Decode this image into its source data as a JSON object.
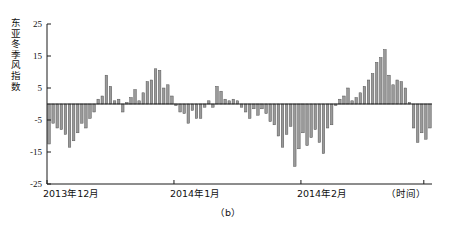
{
  "figure": {
    "caption": "（b）",
    "ylabel_chars": [
      "东",
      "亚",
      "冬",
      "季",
      "风",
      "指",
      "数"
    ]
  },
  "chart_data": {
    "type": "bar",
    "title": "",
    "subtitle": "",
    "xlabel": "（时间）",
    "ylabel": "东亚冬季风指数",
    "caption": "（b）",
    "grid": false,
    "legend": "none",
    "ylim": [
      -25,
      25
    ],
    "yticks": [
      25,
      15,
      5,
      -5,
      -15,
      -25
    ],
    "ytick_labels": [
      "25",
      "15",
      "5",
      "-5",
      "-15",
      "-25"
    ],
    "xtick_positions": [
      0,
      31,
      62,
      92
    ],
    "xtick_labels": [
      "2013年12月",
      "2014年1月",
      "2014年2月",
      "（时间）"
    ],
    "x_axis_note": "逐日 / daily values from 2013-12-01 to 2014-03-02",
    "categories": [
      "12-01",
      "12-02",
      "12-03",
      "12-04",
      "12-05",
      "12-06",
      "12-07",
      "12-08",
      "12-09",
      "12-10",
      "12-11",
      "12-12",
      "12-13",
      "12-14",
      "12-15",
      "12-16",
      "12-17",
      "12-18",
      "12-19",
      "12-20",
      "12-21",
      "12-22",
      "12-23",
      "12-24",
      "12-25",
      "12-26",
      "12-27",
      "12-28",
      "12-29",
      "12-30",
      "12-31",
      "01-01",
      "01-02",
      "01-03",
      "01-04",
      "01-05",
      "01-06",
      "01-07",
      "01-08",
      "01-09",
      "01-10",
      "01-11",
      "01-12",
      "01-13",
      "01-14",
      "01-15",
      "01-16",
      "01-17",
      "01-18",
      "01-19",
      "01-20",
      "01-21",
      "01-22",
      "01-23",
      "01-24",
      "01-25",
      "01-26",
      "01-27",
      "01-28",
      "01-29",
      "01-30",
      "01-31",
      "02-01",
      "02-02",
      "02-03",
      "02-04",
      "02-05",
      "02-06",
      "02-07",
      "02-08",
      "02-09",
      "02-10",
      "02-11",
      "02-12",
      "02-13",
      "02-14",
      "02-15",
      "02-16",
      "02-17",
      "02-18",
      "02-19",
      "02-20",
      "02-21",
      "02-22",
      "02-23",
      "02-24",
      "02-25",
      "02-26",
      "02-27",
      "02-28",
      "03-01",
      "03-02",
      "03-03",
      "03-04"
    ],
    "values": [
      -12.5,
      -6.0,
      -7.5,
      -8.0,
      -9.5,
      -13.5,
      -11.5,
      -9.0,
      -6.0,
      -7.5,
      -4.5,
      -2.5,
      1.5,
      2.5,
      9.0,
      5.5,
      1.0,
      1.5,
      -2.5,
      0.5,
      2.0,
      4.5,
      1.0,
      3.5,
      7.0,
      7.5,
      11.0,
      10.5,
      5.0,
      6.0,
      2.5,
      -0.5,
      -2.5,
      -3.0,
      -6.0,
      -2.0,
      -4.5,
      -4.5,
      -1.0,
      1.0,
      -1.0,
      5.5,
      4.0,
      1.5,
      1.0,
      1.5,
      1.0,
      -1.0,
      -2.5,
      -4.5,
      -1.5,
      -3.5,
      -1.5,
      -3.0,
      -5.5,
      -6.5,
      -10.0,
      -13.5,
      -9.5,
      -7.0,
      -19.5,
      -14.0,
      -9.0,
      -13.0,
      -10.5,
      -8.0,
      -12.0,
      -15.5,
      -7.5,
      -6.5,
      -0.5,
      1.5,
      2.5,
      5.0,
      1.0,
      2.0,
      3.5,
      5.5,
      7.5,
      9.5,
      13.0,
      14.5,
      17.0,
      9.0,
      6.0,
      7.5,
      7.0,
      5.0,
      0.5,
      -7.5,
      -12.0,
      -9.0,
      -11.0,
      -7.5
    ]
  }
}
